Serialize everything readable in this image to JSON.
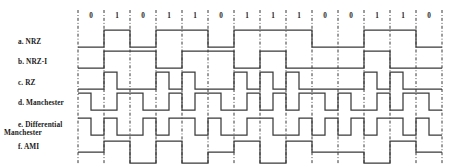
{
  "figure": {
    "bit_sequence": [
      0,
      1,
      0,
      1,
      1,
      0,
      1,
      1,
      1,
      0,
      0,
      1,
      1,
      0
    ],
    "bit_labels": [
      "0",
      "1",
      "0",
      "1",
      "1",
      "0",
      "1",
      "1",
      "1",
      "0",
      "0",
      "1",
      "1",
      "0"
    ],
    "grid": {
      "x_start": 78,
      "x_end": 442,
      "cell_width": 26,
      "cell_count": 14,
      "grid_top": 10,
      "grid_bottom": 165,
      "gridline_color": "#222222",
      "gridline_style": "dash-dot-vertical"
    },
    "signal_color": "#3a3a3a",
    "background_color": "#ffffff",
    "text_color": "#1a1a1a",
    "rows": [
      {
        "id": "nrz",
        "label": "a. NRZ",
        "scheme": "NRZ",
        "baseline_y": 47,
        "high_y": 30,
        "low_y": 47,
        "levels": [
          0,
          1,
          0,
          1,
          1,
          0,
          1,
          1,
          1,
          0,
          0,
          1,
          1,
          0
        ],
        "description": "Level is low for bit 0 and high for bit 1"
      },
      {
        "id": "nrz-i",
        "label": "b. NRZ-I",
        "scheme": "NRZ-I",
        "baseline_y": 68,
        "high_y": 51,
        "low_y": 68,
        "levels": [
          0,
          1,
          1,
          0,
          1,
          1,
          0,
          1,
          0,
          0,
          0,
          1,
          0,
          0
        ],
        "description": "Level inverts at the start of each bit 1; no change for bit 0"
      },
      {
        "id": "rz",
        "label": "c. RZ",
        "scheme": "RZ",
        "baseline_y": 89,
        "high_y": 72,
        "low_y": 89,
        "half_levels": [
          [
            0,
            0
          ],
          [
            1,
            0
          ],
          [
            0,
            0
          ],
          [
            1,
            0
          ],
          [
            1,
            0
          ],
          [
            0,
            0
          ],
          [
            1,
            0
          ],
          [
            1,
            0
          ],
          [
            1,
            0
          ],
          [
            0,
            0
          ],
          [
            0,
            0
          ],
          [
            1,
            0
          ],
          [
            1,
            0
          ],
          [
            0,
            0
          ]
        ],
        "description": "Positive half-pulse then return to zero for bit 1; zero level for bit 0"
      },
      {
        "id": "manchester",
        "label": "d. Manchester",
        "scheme": "Manchester",
        "baseline_y": 110,
        "high_y": 93,
        "low_y": 110,
        "half_levels": [
          [
            1,
            0
          ],
          [
            0,
            1
          ],
          [
            1,
            0
          ],
          [
            0,
            1
          ],
          [
            0,
            1
          ],
          [
            1,
            0
          ],
          [
            0,
            1
          ],
          [
            0,
            1
          ],
          [
            0,
            1
          ],
          [
            1,
            0
          ],
          [
            1,
            0
          ],
          [
            0,
            1
          ],
          [
            0,
            1
          ],
          [
            1,
            0
          ]
        ],
        "description": "Mid-bit transition: high-to-low for bit 0, low-to-high for bit 1"
      },
      {
        "id": "differential-manchester",
        "label": "e. Differential Manchester",
        "label_line_1": "e. Differential",
        "label_line_2": "Manchester",
        "scheme": "Differential Manchester",
        "baseline_y": 135,
        "high_y": 118,
        "low_y": 135,
        "half_levels": [
          [
            1,
            0
          ],
          [
            1,
            0
          ],
          [
            0,
            1
          ],
          [
            0,
            1
          ],
          [
            1,
            0
          ],
          [
            1,
            0
          ],
          [
            0,
            1
          ],
          [
            1,
            0
          ],
          [
            0,
            1
          ],
          [
            0,
            1
          ],
          [
            0,
            1
          ],
          [
            0,
            1
          ],
          [
            1,
            0
          ],
          [
            1,
            0
          ]
        ],
        "description": "Always a mid-bit transition; additional start-of-bit transition for bit 0"
      },
      {
        "id": "ami",
        "label": "f. AMI",
        "scheme": "AMI",
        "baseline_y": 152,
        "high_y": 141,
        "low_y": 163,
        "levels": [
          0,
          1,
          -1,
          1,
          -1,
          0,
          1,
          -1,
          1,
          0,
          0,
          -1,
          1,
          0
        ],
        "description": "Zero level for bit 0; bit 1 alternates between positive and negative polarity"
      }
    ]
  }
}
